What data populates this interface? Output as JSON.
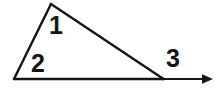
{
  "figure": {
    "type": "geometry-diagram",
    "background_color": "#ffffff",
    "stroke_color": "#151515",
    "stroke_width": 2.4,
    "canvas": {
      "width": 215,
      "height": 97
    },
    "vertices": {
      "apex": {
        "name": "apex-vertex",
        "x": 51,
        "y": 4
      },
      "left": {
        "name": "left-vertex",
        "x": 14,
        "y": 79
      },
      "right": {
        "name": "right-vertex",
        "x": 163,
        "y": 79
      }
    },
    "segments": [
      {
        "name": "left-side",
        "from": "apex",
        "to": "left"
      },
      {
        "name": "hypotenuse",
        "from": "apex",
        "to": "right"
      },
      {
        "name": "base-line",
        "from": "left",
        "to": "right"
      }
    ],
    "ray": {
      "name": "extended-ray",
      "from": {
        "x": 163,
        "y": 79
      },
      "to": {
        "x": 213,
        "y": 79
      },
      "arrowhead": {
        "length": 11,
        "half_width": 5
      }
    },
    "labels": [
      {
        "id": "angle-1",
        "text": "1",
        "x": 56,
        "y": 25
      },
      {
        "id": "angle-2",
        "text": "2",
        "x": 38,
        "y": 63
      },
      {
        "id": "angle-3",
        "text": "3",
        "x": 173,
        "y": 58
      }
    ]
  }
}
